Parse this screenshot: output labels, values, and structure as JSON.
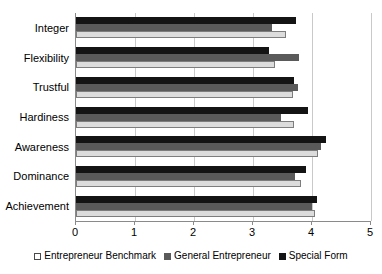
{
  "chart_data": {
    "type": "bar",
    "orientation": "horizontal",
    "title": "",
    "subtitle": "",
    "xlabel": "",
    "ylabel": "",
    "xlim": [
      0,
      5
    ],
    "xticks": [
      "0",
      "1",
      "2",
      "3",
      "4",
      "5"
    ],
    "grid": true,
    "grid_axis": "x",
    "legend_position": "bottom",
    "categories": [
      "Integer",
      "Flexibility",
      "Trustful",
      "Hardiness",
      "Awareness",
      "Dominance",
      "Achievement"
    ],
    "series": [
      {
        "name": "Entrepreneur Benchmark",
        "color": "#dcdcdc",
        "values": [
          3.56,
          3.37,
          3.68,
          3.7,
          4.1,
          3.82,
          4.05
        ]
      },
      {
        "name": "General Entrepreneur",
        "color": "#5a5a5a",
        "values": [
          3.32,
          3.78,
          3.76,
          3.48,
          4.15,
          3.72,
          4.0
        ]
      },
      {
        "name": "Special Form",
        "color": "#141414",
        "values": [
          3.73,
          3.27,
          3.7,
          3.93,
          4.24,
          3.9,
          4.08
        ]
      }
    ]
  },
  "legend": {
    "items": [
      {
        "label": "Entrepreneur Benchmark",
        "swatch": "benchmark"
      },
      {
        "label": "General Entrepreneur",
        "swatch": "general"
      },
      {
        "label": "Special Form",
        "swatch": "special"
      }
    ]
  }
}
